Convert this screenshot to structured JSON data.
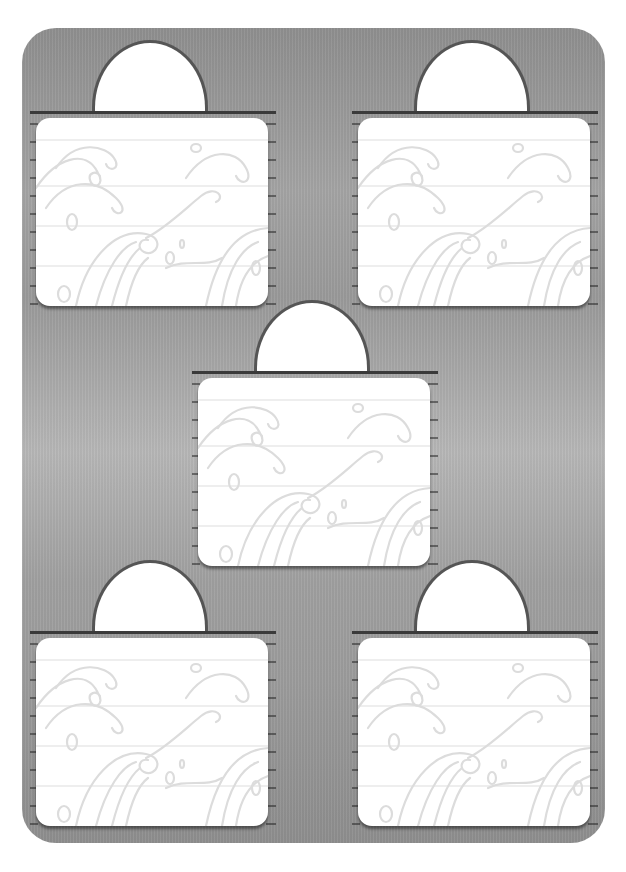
{
  "page": {
    "background_color": "#ffffff",
    "panel_color": "#a0a0a0",
    "line_color": "#3a3a3a",
    "wave_color": "#d8d8d8"
  },
  "cards": [
    {
      "id": "top-left",
      "x": 30,
      "y": 40,
      "label": ""
    },
    {
      "id": "top-right",
      "x": 352,
      "y": 40,
      "label": ""
    },
    {
      "id": "center",
      "x": 192,
      "y": 300,
      "label": ""
    },
    {
      "id": "bottom-left",
      "x": 30,
      "y": 560,
      "label": ""
    },
    {
      "id": "bottom-right",
      "x": 352,
      "y": 560,
      "label": ""
    }
  ]
}
